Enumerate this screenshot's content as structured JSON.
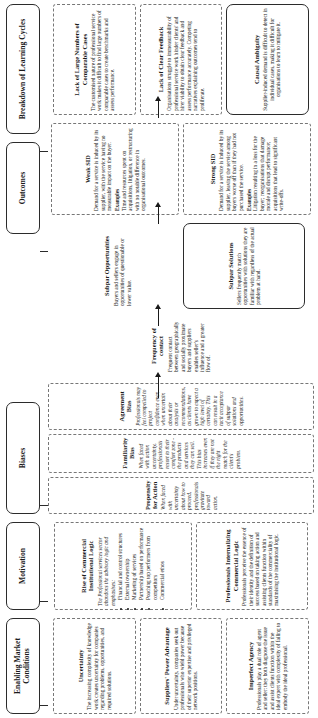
{
  "figure": {
    "orientation": "landscape-rotated-90ccw",
    "columns": [
      {
        "id": "enabling-market-conditions",
        "header": "Enabling Market Conditions",
        "boxes": [
          {
            "title": "Uncertainty",
            "body": "The increasing complexity of knowledge work creates uncertainty for companies regarding problems, opportunities, and required solutions."
          },
          {
            "title": "Suppliers' Power Advantage",
            "body": "Under uncertainty, companies seek out professionals who wield power because of their superior expertise and privileged network positions."
          },
          {
            "title": "Imperfect Agency",
            "body": "Professionals play a dual role of agent and seller: they both diagnose the issue and assist clients function within the ideal expert with complexity of failing to embody the ideal professional."
          }
        ]
      },
      {
        "id": "motivation",
        "header": "Motivation",
        "boxes": [
          {
            "title": "Rise of Commercial Institutional Logic",
            "body": "The Professional services sector abandons the advisory logic and emphasises:",
            "bullets": [
              "Financial and control structures",
              "External ownership",
              "Marketing of services",
              "Partnership based on performance",
              "Poaching top performers from competitors",
              "Commercial ethos"
            ]
          },
          {
            "title": "Professionals Internalizing Commercial Logic",
            "body": "Professionals perceive the essence of their identity and the definition of success based on taking action and assisting clients function within standards of the commerciality of maximising the institutional logic."
          }
        ]
      },
      {
        "id": "biases",
        "header": "Biases",
        "boxes": [
          {
            "title": "Propensity for Action",
            "body": "When faced with uncertainty about how to proceed, professionals gravitate toward action."
          },
          {
            "title": "Familiarity Bias",
            "body": "When faced with action uncertainty, professionals resort to their comfort zone - the products and services they can sell. This bias increases even if they are not the right match for the client's problem."
          },
          {
            "title": "Agreement Bias",
            "body": "Professionals may feel compelled to project confidence even when uncertain about their analysis or recommendations, as clients have grown to expect a high level of certainty. This can result in a tacit acceptance of subpar solutions and opportunities."
          }
        ]
      },
      {
        "id": "frequency-of-contact",
        "header": "Frequency of contact",
        "boxes": [
          {
            "body": "Frequent contact between geographically and socially proximate buyers and suppliers enables seller's influence and a greater flow of."
          }
        ]
      },
      {
        "id": "subpar-opportunities",
        "header": "Subpar Opportunities",
        "boxes": [
          {
            "body": "Buyers and sellers engage in opportunities of questionable or lower value."
          },
          {
            "title": "Subpar Solutions",
            "body": "Sellers frequently match opportunities with solutions they are familiar with regardless of the actual problem at hand."
          }
        ]
      },
      {
        "id": "outcomes",
        "header": "Outcomes",
        "boxes": [
          {
            "title": "Weak SID",
            "body": "Demand for a service is induced by its supplier, with the service having no measurable impact on the buyer.",
            "examples_label": "Examples",
            "examples": "Time and resources spent on acquisitions, litigation, or restructuring with no notable difference in organisational outcomes."
          },
          {
            "title": "Strong SID",
            "body": "Demand for a service is induced by its supplier, leaving the service among buyers worse off than if they had not purchased the service.",
            "examples_label": "Examples",
            "examples": "Litigation resulting in a loss for the buyer; reorganisations that damage morale and disrupt performance; acquisitions that lead to significant write-offs."
          }
        ]
      },
      {
        "id": "breakdown-of-learning-cycles",
        "header": "Breakdown of Learning Cycles",
        "boxes": [
          {
            "title": "Lack of Large Numbers of Comparable Cases",
            "body": "The customised nature of professional service work makes it difficult to find large numbers of comparable cases to create benchmarks and assess performance."
          },
          {
            "title": "Lack of Clear Feedback",
            "body": "Organisations struggle to immeasurability of professional service work hinder clients' and hirer viability to obtain clear feedback and assess performance accurately. Competing narratives explaining outcomes tend to proliferate."
          },
          {
            "title": "Causal Ambiguity",
            "body": "Supplier-induced demand is difficult to detect in individual cases, making it difficult for organisations to learn to mitigate it."
          }
        ]
      }
    ]
  }
}
